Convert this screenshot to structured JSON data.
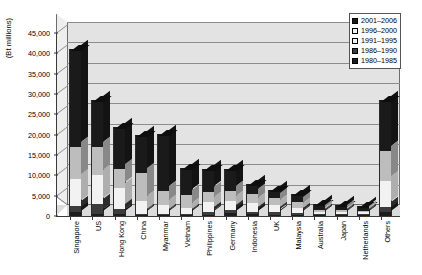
{
  "chart_data": {
    "type": "bar",
    "stacked": true,
    "title": "",
    "xlabel": "",
    "ylabel": "(Bt millions)",
    "ylim": [
      0,
      45000
    ],
    "ytick_step": 5000,
    "yticks": [
      "0",
      "5,000",
      "10,000",
      "15,000",
      "20,000",
      "25,000",
      "30,000",
      "35,000",
      "40,000",
      "45,000"
    ],
    "grid": true,
    "legend_position": "top-right",
    "categories": [
      "Singapore",
      "US",
      "Hong Kong",
      "China",
      "Myanmar",
      "Vietnam",
      "Philippines",
      "Germany",
      "Indonesia",
      "UK",
      "Malaysia",
      "Australia",
      "Japan",
      "Netherlands",
      "Others"
    ],
    "series": [
      {
        "name": "1980–1985",
        "color": "#1d1d1d",
        "values": [
          900,
          600,
          500,
          200,
          150,
          100,
          350,
          700,
          400,
          350,
          300,
          150,
          150,
          120,
          900
        ]
      },
      {
        "name": "1986–1990",
        "color": "#3c3c3c",
        "values": [
          1600,
          2400,
          1200,
          300,
          250,
          150,
          700,
          900,
          700,
          600,
          500,
          250,
          200,
          180,
          1400
        ]
      },
      {
        "name": "1991–1995",
        "color": "#f2f2f2",
        "values": [
          6500,
          7000,
          5300,
          3200,
          2200,
          1500,
          2400,
          2100,
          2200,
          1800,
          1200,
          500,
          450,
          400,
          6200
        ]
      },
      {
        "name": "1996–2000",
        "color": "#bdbdbd",
        "values": [
          8000,
          7000,
          4500,
          6800,
          3400,
          3250,
          2550,
          2400,
          2200,
          1650,
          1400,
          600,
          500,
          400,
          7500
        ]
      },
      {
        "name": "2001–2006",
        "color": "#1a1a1a",
        "values": [
          24000,
          11500,
          10500,
          9500,
          14000,
          6500,
          5500,
          5400,
          2500,
          2100,
          2100,
          1300,
          1200,
          1100,
          12500
        ]
      }
    ],
    "totals": [
      41000,
      28500,
      22000,
      20000,
      20000,
      11500,
      11500,
      11500,
      8000,
      6500,
      5500,
      2800,
      2500,
      2200,
      28500
    ]
  },
  "legend": {
    "items": [
      {
        "label": "2001–2006",
        "swatch": "#1a1a1a"
      },
      {
        "label": "1996–2000",
        "swatch": "#f2f2f2"
      },
      {
        "label": "1991–1995",
        "swatch": "#f2f2f2"
      },
      {
        "label": "1986–1990",
        "swatch": "#3c3c3c"
      },
      {
        "label": "1980–1985",
        "swatch": "#1d1d1d"
      }
    ]
  }
}
